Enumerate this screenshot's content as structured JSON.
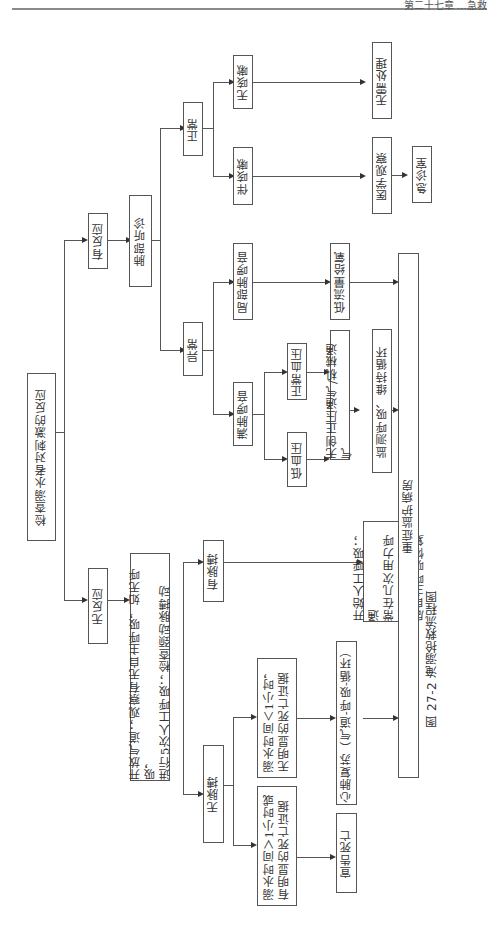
{
  "header": {
    "running_title": "第二十七章 …急救"
  },
  "caption": "图 27-2  淹溺抢救流程图",
  "nodes": {
    "root": "检查溺水者对刺激的反应",
    "no_response": "无反应",
    "has_response": "有反应",
    "open_airway": "开放气道；观察有无自主呼吸，如无呼吸，\n进行5次人工呼吸；检查颈动脉搏动",
    "no_pulse": "无脉搏",
    "has_pulse": "有脉搏",
    "submerged_gt_1h": "溺水时间＞1小时或\n有明显的死亡证据",
    "submerged_lt_1h": "溺水时间＜1小时，\n无明显的死亡证据",
    "declare_death": "宣告死亡",
    "cpr": "心肺复苏（气道-呼吸-循环）",
    "rescue_breathing": "开始人工呼吸；通\n常在几次用力呼吸\n后自主呼吸恢复",
    "icu": "重症监护病房",
    "lung_auscultation": "肺部听诊",
    "abnormal": "异常",
    "normal": "正常",
    "diffuse_rales": "满肺啰音",
    "local_rales": "局部肺啰音",
    "hypotension": "低血压",
    "normal_bp": "正常血压",
    "niv": "无创正压通气/机械通气",
    "monitor": "监测呼吸、维持循环",
    "low_flow_o2": "低流量给氧",
    "with_cough": "伴咳嗽",
    "no_cough": "无咳嗽",
    "medical_observation": "医学观察",
    "er": "急诊室",
    "no_treatment": "无需处理"
  }
}
